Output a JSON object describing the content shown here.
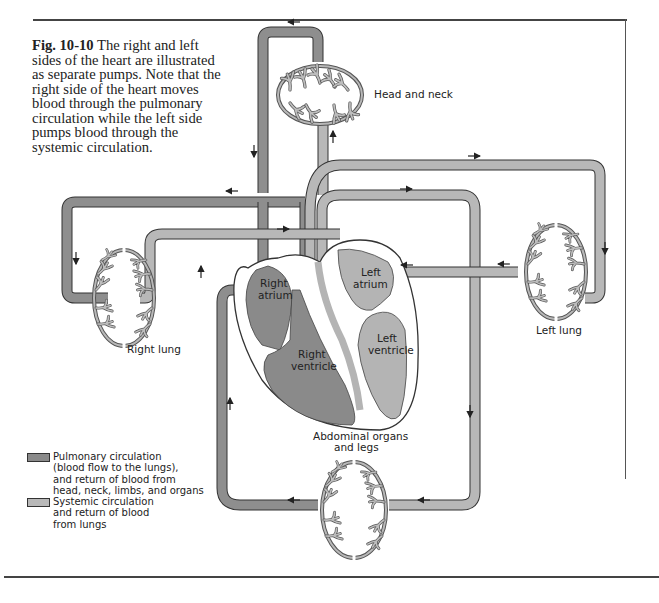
{
  "figure": {
    "number": "Fig. 10-10",
    "caption": "The right and left sides of the heart are illustrated as separate pumps. Note that the right side of the heart moves blood through the pulmonary circulation while the left side pumps blood through the systemic circulation."
  },
  "labels": {
    "head_and_neck": "Head and neck",
    "right_lung": "Right lung",
    "left_lung": "Left lung",
    "right_atrium_1": "Right",
    "right_atrium_2": "atrium",
    "right_ventricle_1": "Right",
    "right_ventricle_2": "ventricle",
    "left_atrium_1": "Left",
    "left_atrium_2": "atrium",
    "left_ventricle_1": "Left",
    "left_ventricle_2": "ventricle",
    "abdominal_1": "Abdominal organs",
    "abdominal_2": "and legs"
  },
  "legend": [
    {
      "color": "#8a8a8a",
      "lines": [
        "Pulmonary circulation",
        "(blood flow to the lungs),",
        "and return of blood from",
        "head, neck, limbs, and organs"
      ]
    },
    {
      "color": "#b8b8b8",
      "lines": [
        "Systemic circulation",
        "and return of blood",
        "from lungs"
      ]
    }
  ],
  "colors": {
    "pulmonary": "#8a8a8a",
    "systemic": "#b8b8b8",
    "outline": "#333333"
  }
}
